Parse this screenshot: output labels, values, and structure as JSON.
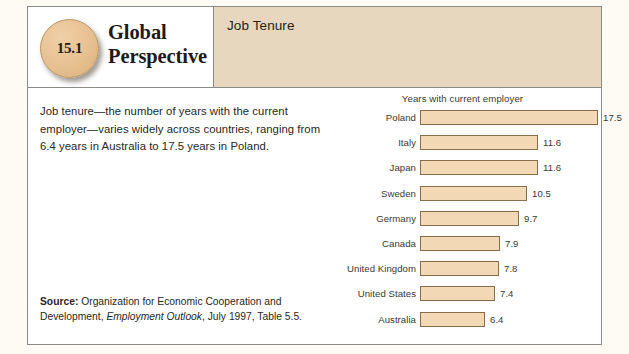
{
  "box": {
    "number_badge": "15.1",
    "feature_title_line1": "Global",
    "feature_title_line2": "Perspective",
    "topic": "Job Tenure"
  },
  "body": {
    "blurb": "Job tenure—the number of years with the current employer—varies widely across countries, ranging from 6.4 years in Australia to 17.5 years in Poland.",
    "source_label": "Source:",
    "source_text_1": " Organization for Economic Cooperation and Development, ",
    "source_italic": "Employment Outlook",
    "source_text_2": ", July 1997, Table 5.5."
  },
  "colors": {
    "bar_fill": "#f2d8b5",
    "bar_border": "#8a6d48",
    "header_band": "#e7d7be",
    "badge_fill": "#e6bf90",
    "page_background": "#fdfbf4",
    "frame_border": "#8d8b86"
  },
  "chart_data": {
    "type": "bar",
    "orientation": "horizontal",
    "title": "Years with current employer",
    "xlabel": "",
    "ylabel": "",
    "xlim": [
      0,
      17.5
    ],
    "grid": false,
    "legend": false,
    "categories": [
      "Poland",
      "Italy",
      "Japan",
      "Sweden",
      "Germany",
      "Canada",
      "United Kingdom",
      "United States",
      "Australia"
    ],
    "values": [
      17.5,
      11.6,
      11.6,
      10.5,
      9.7,
      7.9,
      7.8,
      7.4,
      6.4
    ],
    "value_labels": [
      "17.5",
      "11.6",
      "11.6",
      "10.5",
      "9.7",
      "7.9",
      "7.8",
      "7.4",
      "6.4"
    ]
  }
}
